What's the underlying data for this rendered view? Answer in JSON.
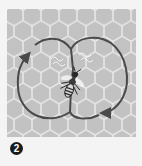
{
  "diagram": {
    "step_badge": "2",
    "colors": {
      "comb_fill": "#c2c2c2",
      "comb_lines": "#ececec",
      "path_stroke": "#4a4a4a",
      "badge_bg": "#1a1a1a",
      "page_bg": "#f4f4f4"
    },
    "elements": {
      "left_loop": "Return loop circling counter-clockwise on the left",
      "right_loop": "Return loop circling clockwise on the right",
      "waggle_run": "Central straight waggle run with bee",
      "bee": "Dancing bee in center"
    }
  }
}
